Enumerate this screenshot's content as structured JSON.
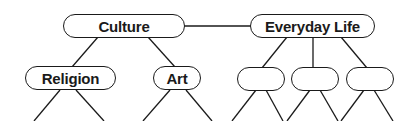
{
  "diagram": {
    "type": "concept-tree",
    "colors": {
      "stroke": "#1a1a1a",
      "fill": "#ffffff",
      "text": "#1a1a1a"
    },
    "nodes": {
      "culture": {
        "label": "Culture"
      },
      "everyday_life": {
        "label": "Everyday Life"
      },
      "religion": {
        "label": "Religion"
      },
      "art": {
        "label": "Art"
      },
      "blank_1": {
        "label": ""
      },
      "blank_2": {
        "label": ""
      },
      "blank_3": {
        "label": ""
      }
    },
    "edges": [
      [
        "culture",
        "everyday_life"
      ],
      [
        "culture",
        "religion"
      ],
      [
        "culture",
        "art"
      ],
      [
        "everyday_life",
        "blank_1"
      ],
      [
        "everyday_life",
        "blank_2"
      ],
      [
        "everyday_life",
        "blank_3"
      ]
    ]
  }
}
